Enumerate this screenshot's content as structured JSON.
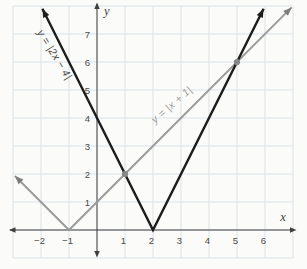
{
  "figure": {
    "background": "#fbfbf9",
    "grid_color": "#dde3e8",
    "axis_color": "#3f3f3f",
    "tick_color": "#4a4a4a",
    "x_axis_label": "x",
    "y_axis_label": "y",
    "x_tick_labels": [
      {
        "v": -2,
        "t": "−2"
      },
      {
        "v": -1,
        "t": "−1"
      },
      {
        "v": 1,
        "t": "1"
      },
      {
        "v": 2,
        "t": "2"
      },
      {
        "v": 3,
        "t": "3"
      },
      {
        "v": 4,
        "t": "4"
      },
      {
        "v": 5,
        "t": "5"
      },
      {
        "v": 6,
        "t": "6"
      }
    ],
    "y_tick_labels": [
      {
        "v": 1,
        "t": "1"
      },
      {
        "v": 2,
        "t": "2"
      },
      {
        "v": 3,
        "t": "3"
      },
      {
        "v": 4,
        "t": "4"
      },
      {
        "v": 5,
        "t": "5"
      },
      {
        "v": 6,
        "t": "6"
      },
      {
        "v": 7,
        "t": "7"
      }
    ]
  },
  "chart_data": {
    "type": "line",
    "title": "",
    "xlabel": "x",
    "ylabel": "y",
    "xlim": [
      -3,
      7
    ],
    "ylim": [
      -1,
      8
    ],
    "grid": true,
    "legend_position": "none",
    "series": [
      {
        "name": "y = |x + 1|",
        "equation": "y = |x + 1|",
        "color": "#9b9b9b",
        "arrow_color": "#7d7d7d",
        "stroke_width": 2,
        "vertex": [
          -1,
          0
        ],
        "x": [
          -2.93,
          -1,
          6.95
        ],
        "y": [
          1.93,
          0,
          7.95
        ],
        "label": "y = |x + 1|",
        "label_color": "#9b9b9b",
        "label_x": 2.75,
        "label_y": 4.38,
        "label_rotation_deg": -41
      },
      {
        "name": "y = |2x − 4|",
        "equation": "y = |2x - 4|",
        "color": "#1d1d1d",
        "arrow_color": "#1d1d1d",
        "stroke_width": 2.4,
        "vertex": [
          2,
          0
        ],
        "x": [
          -1.95,
          2,
          5.95
        ],
        "y": [
          7.9,
          0,
          7.9
        ],
        "label": "y = |2x − 4|",
        "label_color": "#474747",
        "label_x": -1.62,
        "label_y": 6.2,
        "label_rotation_deg": 58
      }
    ],
    "intersections": {
      "points": [
        [
          1,
          2
        ],
        [
          5,
          6
        ]
      ],
      "color": "#878787",
      "radius": 3.1
    }
  }
}
